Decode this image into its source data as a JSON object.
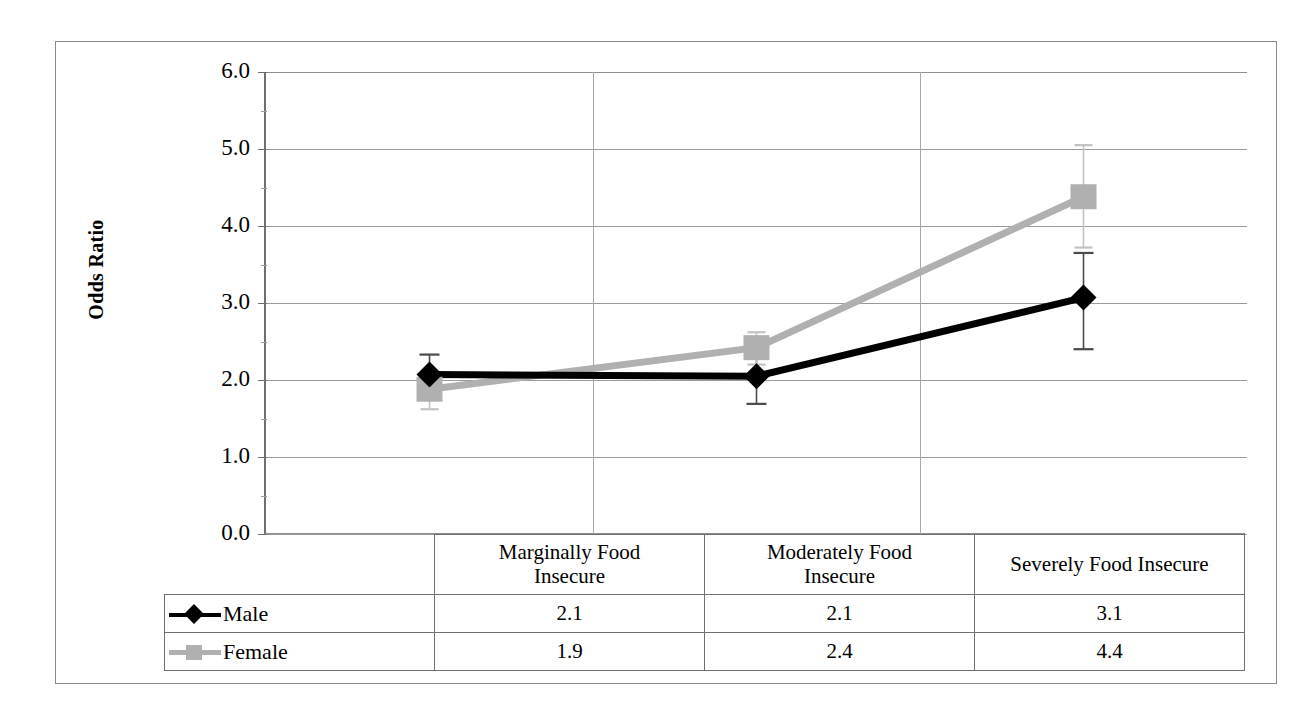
{
  "chart_data": {
    "type": "line",
    "title": "",
    "xlabel": "",
    "ylabel": "Odds Ratio",
    "ylim": [
      0.0,
      6.0
    ],
    "ytick_labels": [
      "0.0",
      "1.0",
      "2.0",
      "3.0",
      "4.0",
      "5.0",
      "6.0"
    ],
    "ytick_values": [
      0.0,
      1.0,
      2.0,
      3.0,
      4.0,
      5.0,
      6.0
    ],
    "grid": true,
    "legend_position": "bottom-table",
    "categories": [
      "Marginally Food Insecure",
      "Moderately Food Insecure",
      "Severely Food Insecure"
    ],
    "category_lines": [
      [
        "Marginally Food",
        "Insecure"
      ],
      [
        "Moderately Food",
        "Insecure"
      ],
      [
        "Severely Food Insecure"
      ]
    ],
    "series": [
      {
        "name": "Male",
        "color": "#000000",
        "marker": "diamond",
        "values": [
          2.07,
          2.05,
          3.07
        ],
        "table_values": [
          "2.1",
          "2.1",
          "3.1"
        ],
        "error_upper": [
          2.33,
          2.38,
          3.65
        ],
        "error_lower": [
          1.81,
          1.69,
          2.4
        ]
      },
      {
        "name": "Female",
        "color": "#b0b0b0",
        "marker": "square",
        "values": [
          1.88,
          2.42,
          4.38
        ],
        "table_values": [
          "1.9",
          "2.4",
          "4.4"
        ],
        "error_upper": [
          2.08,
          2.62,
          5.05
        ],
        "error_lower": [
          1.62,
          2.2,
          3.72
        ]
      }
    ]
  },
  "axis": {
    "y_title": "Odds Ratio"
  },
  "table": {
    "rows": [
      {
        "legend": "Male",
        "values": [
          "2.1",
          "2.1",
          "3.1"
        ]
      },
      {
        "legend": "Female",
        "values": [
          "1.9",
          "2.4",
          "4.4"
        ]
      }
    ]
  },
  "colors": {
    "male": "#000000",
    "female": "#b0b0b0",
    "grid": "#9a9a9a",
    "axis": "#6e6e6e",
    "border": "#8a8a8a"
  }
}
